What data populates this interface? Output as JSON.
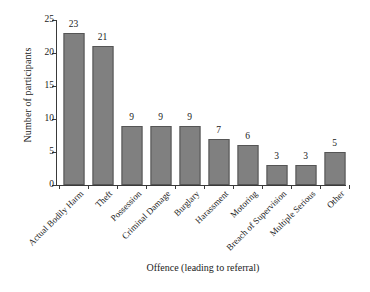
{
  "chart_data": {
    "type": "bar",
    "title": "",
    "xlabel": "Offence (leading to referral)",
    "ylabel": "Number of participants",
    "categories": [
      "Actual Bodily Harm",
      "Theft",
      "Possession",
      "Criminal Damage",
      "Burglary",
      "Harassment",
      "Motoring",
      "Breach of Supervision",
      "Multiple Serious",
      "Other"
    ],
    "values": [
      23,
      21,
      9,
      9,
      9,
      7,
      6,
      3,
      3,
      5
    ],
    "data_labels": [
      "23",
      "21",
      "9",
      "9",
      "9",
      "7",
      "6",
      "3",
      "3",
      "5"
    ],
    "ylim": [
      0,
      25
    ],
    "ytick_values": [
      0,
      5,
      10,
      15,
      20,
      25
    ],
    "ytick_labels": [
      "0",
      "5",
      "10",
      "15",
      "20",
      "25"
    ],
    "grid": false,
    "legend": null,
    "bar_color": "#808080",
    "bar_edge_color": "#555555",
    "axis_color": "#3a3a3a",
    "background": "#ffffff",
    "xtick_label_rotation": 45
  }
}
